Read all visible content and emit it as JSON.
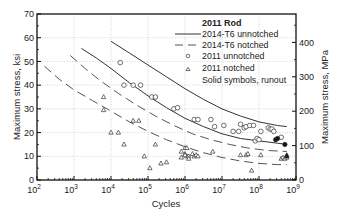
{
  "chart_data": {
    "type": "scatter",
    "title": "2011 Rod",
    "xlabel": "Cycles",
    "ylabel_left": "Maximum stress, ksi",
    "ylabel_right": "Maximum stress, MPa",
    "xscale": "log",
    "xlim": [
      100,
      1000000000
    ],
    "ylim_left": [
      0,
      70
    ],
    "ylim_right": [
      0,
      483
    ],
    "x_ticks": [
      {
        "exp": 2,
        "label": "10",
        "sup": "2"
      },
      {
        "exp": 3,
        "label": "10",
        "sup": "3"
      },
      {
        "exp": 4,
        "label": "10",
        "sup": "4"
      },
      {
        "exp": 5,
        "label": "10",
        "sup": "5"
      },
      {
        "exp": 6,
        "label": "10",
        "sup": "6"
      },
      {
        "exp": 7,
        "label": "10",
        "sup": "7"
      },
      {
        "exp": 8,
        "label": "10",
        "sup": "8"
      },
      {
        "exp": 9,
        "label": "10",
        "sup": "9"
      }
    ],
    "y_ticks_left": [
      "0",
      "10",
      "20",
      "30",
      "40",
      "50",
      "60",
      "70"
    ],
    "y_ticks_right": [
      "0",
      "100",
      "200",
      "300",
      "400"
    ],
    "grid": true,
    "legend": {
      "position": "upper right",
      "title": "2011 Rod",
      "entries": [
        {
          "label": "2014-T6 unnotched",
          "style": "solid-line"
        },
        {
          "label": "2014-T6  notched",
          "style": "dashed-line"
        },
        {
          "label": "2011 unnotched",
          "style": "open-circle"
        },
        {
          "label": "2011 notched",
          "style": "open-triangle"
        },
        {
          "label": "Solid symbols, runout",
          "style": "text"
        }
      ]
    },
    "series": [
      {
        "name": "2014-T6 unnotched",
        "style": "solid",
        "curves": [
          {
            "points": [
              [
                4.0,
                58.5
              ],
              [
                4.5,
                53.5
              ],
              [
                5.0,
                48.5
              ],
              [
                5.5,
                43.5
              ],
              [
                6.0,
                38.5
              ],
              [
                6.5,
                34.0
              ],
              [
                7.0,
                30.0
              ],
              [
                7.5,
                27.0
              ],
              [
                8.0,
                24.5
              ],
              [
                8.5,
                23.0
              ],
              [
                8.75,
                22.5
              ]
            ]
          },
          {
            "points": [
              [
                3.2,
                55.5
              ],
              [
                3.6,
                51.5
              ],
              [
                4.0,
                47.0
              ],
              [
                4.5,
                41.0
              ],
              [
                5.0,
                35.5
              ],
              [
                5.5,
                30.5
              ],
              [
                6.0,
                26.0
              ],
              [
                6.5,
                22.5
              ],
              [
                7.0,
                19.5
              ],
              [
                7.5,
                17.5
              ],
              [
                8.0,
                16.5
              ],
              [
                8.5,
                15.5
              ],
              [
                8.75,
                15.0
              ]
            ]
          }
        ]
      },
      {
        "name": "2014-T6 notched",
        "style": "dashed",
        "curves": [
          {
            "points": [
              [
                2.9,
                52.5
              ],
              [
                3.3,
                47.0
              ],
              [
                3.7,
                42.0
              ],
              [
                4.2,
                36.5
              ],
              [
                4.7,
                31.5
              ],
              [
                5.2,
                27.0
              ],
              [
                5.7,
                23.0
              ],
              [
                6.2,
                19.5
              ],
              [
                6.7,
                17.0
              ],
              [
                7.2,
                15.0
              ],
              [
                7.7,
                13.5
              ],
              [
                8.2,
                12.5
              ],
              [
                8.75,
                12.0
              ]
            ]
          },
          {
            "points": [
              [
                2.2,
                48.0
              ],
              [
                2.6,
                42.5
              ],
              [
                3.0,
                38.0
              ],
              [
                3.5,
                33.5
              ],
              [
                4.0,
                29.0
              ],
              [
                4.5,
                24.5
              ],
              [
                5.0,
                20.5
              ],
              [
                5.5,
                17.0
              ],
              [
                6.0,
                14.0
              ],
              [
                6.5,
                11.5
              ],
              [
                7.0,
                9.5
              ],
              [
                7.5,
                8.0
              ],
              [
                8.0,
                7.0
              ],
              [
                8.5,
                6.5
              ],
              [
                8.75,
                6.5
              ]
            ]
          }
        ]
      },
      {
        "name": "2011 unnotched",
        "marker": "open-circle",
        "points": [
          [
            4.25,
            49.5
          ],
          [
            4.35,
            40.0
          ],
          [
            4.6,
            40.0
          ],
          [
            4.8,
            40.0
          ],
          [
            5.1,
            35.0
          ],
          [
            5.2,
            35.0
          ],
          [
            5.7,
            30.0
          ],
          [
            5.8,
            30.5
          ],
          [
            6.25,
            25.5
          ],
          [
            6.35,
            25.5
          ],
          [
            6.7,
            25.5
          ],
          [
            6.8,
            22.5
          ],
          [
            7.05,
            23.0
          ],
          [
            7.3,
            20.5
          ],
          [
            7.45,
            20.5
          ],
          [
            7.5,
            23.5
          ],
          [
            7.6,
            22.0
          ],
          [
            7.65,
            22.5
          ],
          [
            7.75,
            23.0
          ],
          [
            7.85,
            23.0
          ],
          [
            7.9,
            16.5
          ],
          [
            7.95,
            17.5
          ],
          [
            8.0,
            17.0
          ],
          [
            8.05,
            20.5
          ],
          [
            8.25,
            22.0
          ],
          [
            8.3,
            21.5
          ],
          [
            8.35,
            21.5
          ],
          [
            8.4,
            20.5
          ],
          [
            8.6,
            18.0
          ]
        ]
      },
      {
        "name": "2011 unnotched runout",
        "marker": "filled-circle",
        "points": [
          [
            8.45,
            17.0
          ],
          [
            8.5,
            17.5
          ],
          [
            8.7,
            15.0
          ]
        ]
      },
      {
        "name": "2011 notched",
        "marker": "open-triangle",
        "points": [
          [
            3.8,
            35.0
          ],
          [
            3.8,
            29.5
          ],
          [
            4.0,
            20.0
          ],
          [
            4.2,
            20.0
          ],
          [
            4.35,
            15.0
          ],
          [
            4.6,
            25.0
          ],
          [
            4.75,
            25.0
          ],
          [
            4.9,
            10.0
          ],
          [
            5.05,
            5.0
          ],
          [
            5.2,
            15.0
          ],
          [
            5.35,
            7.0
          ],
          [
            5.5,
            7.5
          ],
          [
            5.9,
            12.0
          ],
          [
            5.9,
            9.5
          ],
          [
            6.0,
            13.5
          ],
          [
            6.05,
            13.5
          ],
          [
            6.0,
            11.0
          ],
          [
            6.05,
            10.0
          ],
          [
            6.0,
            10.5
          ],
          [
            6.1,
            10.0
          ],
          [
            6.1,
            9.0
          ],
          [
            6.2,
            11.0
          ],
          [
            6.25,
            10.0
          ],
          [
            6.3,
            10.5
          ],
          [
            6.35,
            10.0
          ],
          [
            6.75,
            12.0
          ],
          [
            7.5,
            10.5
          ],
          [
            7.65,
            10.5
          ],
          [
            7.7,
            11.0
          ],
          [
            7.8,
            4.0
          ],
          [
            8.05,
            10.5
          ],
          [
            8.6,
            9.0
          ],
          [
            8.65,
            9.5
          ],
          [
            8.7,
            9.0
          ],
          [
            8.75,
            9.5
          ]
        ]
      },
      {
        "name": "2011 notched runout",
        "marker": "filled-triangle",
        "points": [
          [
            8.75,
            10.0
          ],
          [
            8.75,
            10.5
          ]
        ]
      }
    ]
  }
}
